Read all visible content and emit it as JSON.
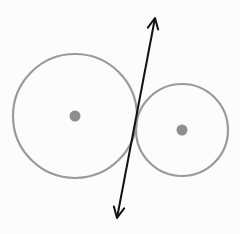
{
  "diagram": {
    "colors": {
      "background": "#fcfcfc",
      "circle_stroke": "#9a9a9a",
      "center_dot": "#8e8e8e",
      "tangent_line": "#111111"
    },
    "circles": [
      {
        "name": "large-circle",
        "cx": 75,
        "cy": 116,
        "r": 62,
        "center_dot_r": 5.5
      },
      {
        "name": "small-circle",
        "cx": 182,
        "cy": 130,
        "r": 46,
        "center_dot_r": 5.5
      }
    ],
    "tangent_line": {
      "x1": 155,
      "y1": 18,
      "x2": 117,
      "y2": 218,
      "arrowheads": "both"
    }
  }
}
